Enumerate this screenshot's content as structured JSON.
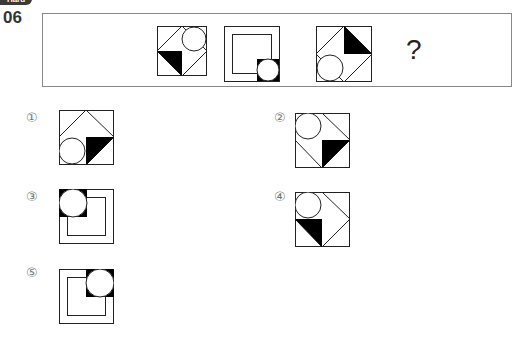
{
  "question": {
    "badge": "Hard",
    "number": "06",
    "missing_mark": "?"
  },
  "sequence": [
    {
      "id": "seq-1",
      "description": "diamond-half with circle top-right, black triangle bottom-left"
    },
    {
      "id": "seq-2",
      "description": "nested square with circle bottom-right"
    },
    {
      "id": "seq-3",
      "description": "diamond-half with circle bottom-left, black triangle top-right"
    }
  ],
  "options": [
    {
      "label": "①",
      "value": 1
    },
    {
      "label": "②",
      "value": 2
    },
    {
      "label": "③",
      "value": 3
    },
    {
      "label": "④",
      "value": 4
    },
    {
      "label": "⑤",
      "value": 5
    }
  ],
  "colors": {
    "stroke": "#222222",
    "fill": "#000000",
    "frame": "#888888"
  }
}
